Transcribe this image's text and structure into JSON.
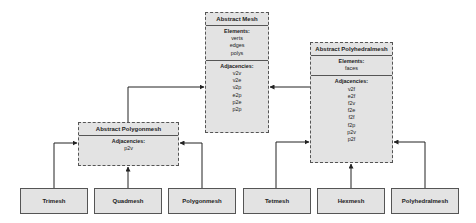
{
  "abstract_mesh": {
    "title": "Abstract Mesh",
    "elements_label": "Elements:",
    "elements": [
      "verts",
      "edges",
      "polys"
    ],
    "adjacencies_label": "Adjacencies:",
    "adjacencies": [
      "v2v",
      "v2e",
      "v2p",
      "e2p",
      "p2e",
      "p2p"
    ]
  },
  "abstract_polyhedralmesh": {
    "title": "Abstract Polyhedralmesh",
    "elements_label": "Elements:",
    "elements": [
      "faces"
    ],
    "adjacencies_label": "Adjacencies:",
    "adjacencies": [
      "v2f",
      "e2f",
      "f2v",
      "f2e",
      "f2f",
      "f2p",
      "p2v",
      "p2f"
    ]
  },
  "abstract_polygonmesh": {
    "title": "Abstract Polygonmesh",
    "adjacencies_label": "Adjacencies:",
    "adjacencies": [
      "p2v"
    ]
  },
  "concrete": [
    "Trimesh",
    "Quadmesh",
    "Polygonmesh",
    "Tetmesh",
    "Hexmesh",
    "Polyhedralmesh"
  ]
}
